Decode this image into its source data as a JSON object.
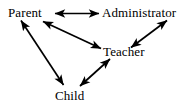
{
  "diagram": {
    "type": "relationship-diagram",
    "background_color": "#ffffff",
    "stroke_color": "#000000",
    "nodes": [
      {
        "id": "parent",
        "label": "Parent",
        "x": 33,
        "y": 13
      },
      {
        "id": "administrator",
        "label": "Administrator",
        "x": 143,
        "y": 13
      },
      {
        "id": "teacher",
        "label": "Teacher",
        "x": 128,
        "y": 52
      },
      {
        "id": "child",
        "label": "Child",
        "x": 71,
        "y": 96
      }
    ],
    "edges": [
      {
        "id": "parent-administrator",
        "from": "parent",
        "to": "administrator",
        "direction": "bidirectional"
      },
      {
        "id": "parent-teacher",
        "from": "parent",
        "to": "teacher",
        "direction": "bidirectional"
      },
      {
        "id": "administrator-teacher",
        "from": "administrator",
        "to": "teacher",
        "direction": "bidirectional"
      },
      {
        "id": "parent-child",
        "from": "parent",
        "to": "child",
        "direction": "bidirectional"
      },
      {
        "id": "child-teacher",
        "from": "child",
        "to": "teacher",
        "direction": "bidirectional"
      }
    ]
  }
}
